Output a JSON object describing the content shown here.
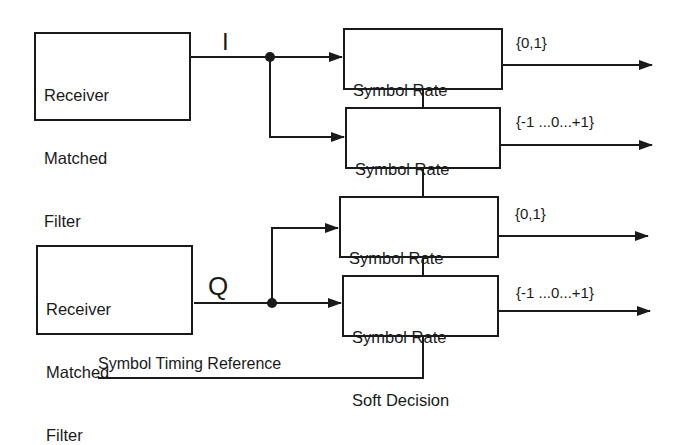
{
  "diagram": {
    "type": "block-diagram",
    "colors": {
      "line": "#1a1a1a",
      "background": "#ffffff"
    },
    "filters": [
      {
        "id": "filter-i",
        "label_lines": [
          "Receiver",
          "Matched",
          "Filter"
        ],
        "channel": "I"
      },
      {
        "id": "filter-q",
        "label_lines": [
          "Receiver",
          "Matched",
          "Filter"
        ],
        "channel": "Q"
      }
    ],
    "channels": {
      "i": "I",
      "q": "Q"
    },
    "decision_blocks": [
      {
        "id": "i-hard",
        "line1": "Symbol Rate",
        "line2": "Hard Decision",
        "output": "{0,1}"
      },
      {
        "id": "i-soft",
        "line1": "Symbol Rate",
        "line2": "Soft Decision",
        "output": "{-1 ...0...+1}"
      },
      {
        "id": "q-hard",
        "line1": "Symbol Rate",
        "line2": "Hard Decision",
        "output": "{0,1}"
      },
      {
        "id": "q-soft",
        "line1": "Symbol Rate",
        "line2": "Soft Decision",
        "output": "{-1 ...0...+1}"
      }
    ],
    "timing_reference": "Symbol Timing Reference"
  }
}
